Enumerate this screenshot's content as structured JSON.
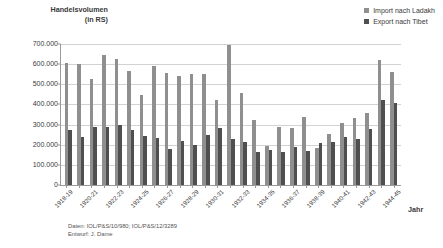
{
  "chart_data": {
    "type": "bar",
    "title": "",
    "ylabel": "Handelsvolumen (in RS)",
    "ylabel_line1": "Handelsvolumen",
    "ylabel_line2": "(in RS)",
    "xlabel": "Jahr",
    "ylim": [
      0,
      700000
    ],
    "ytick_step": 100000,
    "grid": true,
    "legend_position": "top-right",
    "ytick_labels": [
      "700.000",
      "600.000",
      "500.000",
      "400.000",
      "300.000",
      "200.000",
      "100.000",
      "0"
    ],
    "ytick_values": [
      700000,
      600000,
      500000,
      400000,
      300000,
      200000,
      100000,
      0
    ],
    "categories": [
      "1918-19",
      "1919-20",
      "1920-21",
      "1921-22",
      "1922-23",
      "1923-24",
      "1924-25",
      "1925-26",
      "1926-27",
      "1927-28",
      "1928-29",
      "1929-30",
      "1930-31",
      "1931-32",
      "1932-33",
      "1933-34",
      "1934-35",
      "1935-36",
      "1936-37",
      "1937-38",
      "1938-39",
      "1939-40",
      "1940-41",
      "1941-42",
      "1942-43",
      "1943-44",
      "1944-45"
    ],
    "xtick_labels_shown": [
      "1918-19",
      "1920-21",
      "1922-23",
      "1924-25",
      "1926-27",
      "1928-29",
      "1930-31",
      "1932-33",
      "1934-35",
      "1936-37",
      "1938-39",
      "1940-41",
      "1942-43",
      "1944-45"
    ],
    "series": [
      {
        "name": "Import nach Ladakh",
        "color": "#8f8f8f",
        "values": [
          605000,
          600000,
          527000,
          643000,
          627000,
          568000,
          449000,
          592000,
          556000,
          543000,
          551000,
          552000,
          424000,
          694000,
          456000,
          325000,
          196000,
          290000,
          281000,
          338000,
          186000,
          252000,
          306000,
          333000,
          358000,
          622000,
          561000
        ]
      },
      {
        "name": "Export nach Tibet",
        "color": "#4f4f4f",
        "values": [
          275000,
          240000,
          287000,
          286000,
          296000,
          272000,
          244000,
          232000,
          180000,
          219000,
          199000,
          247000,
          281000,
          230000,
          214000,
          163000,
          172000,
          164000,
          188000,
          168000,
          208000,
          216000,
          240000,
          230000,
          277000,
          421000,
          405000
        ]
      }
    ],
    "source_note_line1": "Daten: IOL/P&S/10/980; IOL/P&S/12/3289",
    "source_note_line2": "Entwurf: J. Dame"
  },
  "legend": {
    "items": [
      {
        "label": "Import nach Ladakh",
        "color": "#8f8f8f"
      },
      {
        "label": "Export nach Tibet",
        "color": "#4f4f4f"
      }
    ]
  }
}
